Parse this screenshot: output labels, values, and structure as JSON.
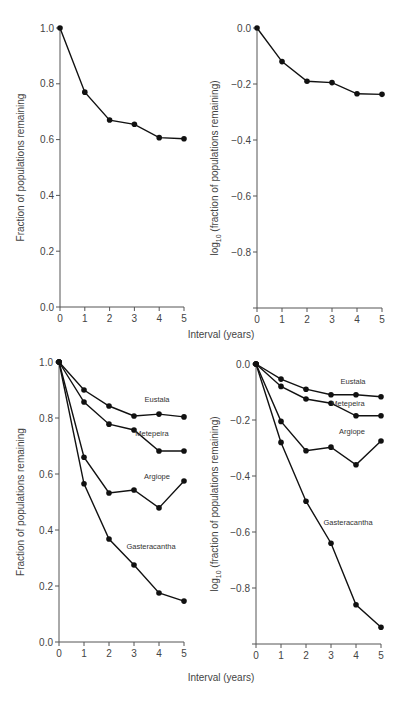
{
  "chart_data": [
    {
      "id": "top-left",
      "type": "line",
      "title": "",
      "xlabel": "",
      "ylabel": "Fraction of populations remaining",
      "x": [
        0,
        1,
        2,
        3,
        4,
        5
      ],
      "xticks": [
        "0",
        "1",
        "2",
        "3",
        "4",
        "5"
      ],
      "yticks": [
        "0.0",
        "0.2",
        "0.4",
        "0.6",
        "0.8",
        "1.0"
      ],
      "ylim": [
        0,
        1.0
      ],
      "grid": false,
      "series": [
        {
          "name": "All species",
          "values": [
            1.0,
            0.77,
            0.67,
            0.655,
            0.607,
            0.603
          ]
        }
      ]
    },
    {
      "id": "top-right",
      "type": "line",
      "title": "",
      "xlabel": "",
      "ylabel": "log10 (fraction of populations remaining)",
      "x": [
        0,
        1,
        2,
        3,
        4,
        5
      ],
      "xticks": [
        "0",
        "1",
        "2",
        "3",
        "4",
        "5"
      ],
      "yticks": [
        "0.0",
        "-0.2",
        "-0.4",
        "-0.6",
        "-0.8"
      ],
      "ylim": [
        -1.0,
        0
      ],
      "grid": false,
      "series": [
        {
          "name": "All species",
          "values": [
            0.0,
            -0.12,
            -0.19,
            -0.195,
            -0.235,
            -0.237
          ]
        }
      ]
    },
    {
      "id": "bottom-left",
      "type": "line",
      "title": "",
      "xlabel": "Interval (years)",
      "ylabel": "Fraction of populations remaining",
      "x": [
        0,
        1,
        2,
        3,
        4,
        5
      ],
      "xticks": [
        "0",
        "1",
        "2",
        "3",
        "4",
        "5"
      ],
      "yticks": [
        "0.0",
        "0.2",
        "0.4",
        "0.6",
        "0.8",
        "1.0"
      ],
      "ylim": [
        0,
        1.0
      ],
      "grid": false,
      "legend": "inline labels",
      "series": [
        {
          "name": "Eustala",
          "values": [
            1.0,
            0.9,
            0.843,
            0.807,
            0.814,
            0.804
          ]
        },
        {
          "name": "Metepeira",
          "values": [
            1.0,
            0.857,
            0.778,
            0.757,
            0.682,
            0.682
          ]
        },
        {
          "name": "Argiope",
          "values": [
            1.0,
            0.66,
            0.532,
            0.543,
            0.479,
            0.575
          ]
        },
        {
          "name": "Gasteracantha",
          "values": [
            1.0,
            0.565,
            0.368,
            0.275,
            0.175,
            0.146
          ]
        }
      ]
    },
    {
      "id": "bottom-right",
      "type": "line",
      "title": "",
      "xlabel": "Interval (years)",
      "ylabel": "log10 (fraction of populations remaining)",
      "x": [
        0,
        1,
        2,
        3,
        4,
        5
      ],
      "xticks": [
        "0",
        "1",
        "2",
        "3",
        "4",
        "5"
      ],
      "yticks": [
        "0.0",
        "-0.2",
        "-0.4",
        "-0.6",
        "-0.8"
      ],
      "ylim": [
        -1.0,
        0
      ],
      "grid": false,
      "legend": "inline labels",
      "series": [
        {
          "name": "Eustala",
          "values": [
            0.0,
            -0.054,
            -0.09,
            -0.11,
            -0.11,
            -0.117
          ]
        },
        {
          "name": "Metepeira",
          "values": [
            0.0,
            -0.08,
            -0.125,
            -0.14,
            -0.185,
            -0.185
          ]
        },
        {
          "name": "Argiope",
          "values": [
            0.0,
            -0.205,
            -0.31,
            -0.297,
            -0.36,
            -0.275
          ]
        },
        {
          "name": "Gasteracantha",
          "values": [
            0.0,
            -0.28,
            -0.49,
            -0.64,
            -0.86,
            -0.94
          ]
        }
      ]
    }
  ],
  "labels": {
    "x_axis_title": "Interval (years)",
    "y_fraction": "Fraction of populations remaining",
    "y_log_prefix": "log",
    "y_log_sub": "10",
    "y_log_suffix": " (fraction of populations remaining)"
  },
  "series_label_positions": {
    "bottom-left": {
      "Eustala": [
        157,
        402
      ],
      "Metepeira": [
        152,
        436
      ],
      "Argiope": [
        157,
        479
      ],
      "Gasteracantha": [
        151,
        549
      ]
    },
    "bottom-right": {
      "Eustala": [
        353,
        384
      ],
      "Metepeira": [
        348,
        406
      ],
      "Argiope": [
        352,
        434
      ],
      "Gasteracantha": [
        348,
        525
      ]
    }
  }
}
